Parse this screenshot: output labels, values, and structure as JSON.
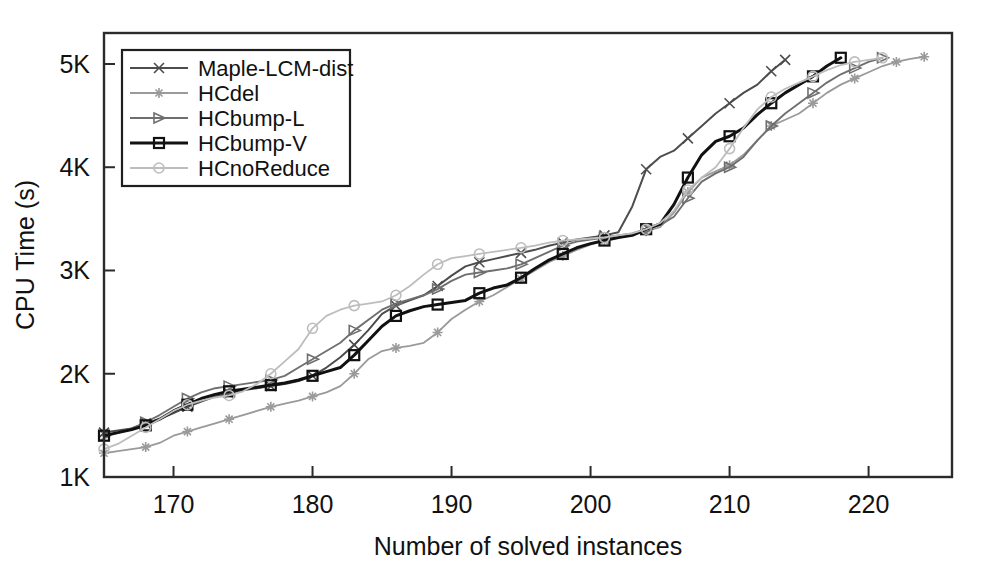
{
  "chart_data": {
    "type": "line",
    "title": "",
    "xlabel": "Number of solved instances",
    "ylabel": "CPU Time (s)",
    "xlim": [
      165,
      226
    ],
    "ylim": [
      1000,
      5300
    ],
    "grid": false,
    "legend_position": "top-left",
    "xticks": [
      170,
      180,
      190,
      200,
      210,
      220
    ],
    "xticklabels": [
      "170",
      "180",
      "190",
      "200",
      "210",
      "220"
    ],
    "yticks": [
      1000,
      2000,
      3000,
      4000,
      5000
    ],
    "yticklabels": [
      "1K",
      "2K",
      "3K",
      "4K",
      "5K"
    ],
    "series": [
      {
        "name": "Maple-LCM-dist",
        "color": "#4d4d4d",
        "width": 2.0,
        "marker": "x",
        "marker_every": 3,
        "x": [
          165,
          166,
          167,
          168,
          169,
          170,
          171,
          172,
          173,
          174,
          175,
          176,
          177,
          178,
          179,
          180,
          181,
          182,
          183,
          184,
          185,
          186,
          187,
          188,
          189,
          190,
          191,
          192,
          193,
          194,
          195,
          196,
          197,
          198,
          199,
          200,
          201,
          202,
          203,
          204,
          205,
          206,
          207,
          208,
          209,
          210,
          211,
          212,
          213,
          214
        ],
        "y": [
          1430,
          1450,
          1470,
          1520,
          1560,
          1620,
          1680,
          1730,
          1780,
          1810,
          1840,
          1860,
          1880,
          1900,
          1930,
          1980,
          2060,
          2160,
          2280,
          2420,
          2580,
          2660,
          2710,
          2760,
          2850,
          2950,
          3040,
          3080,
          3110,
          3140,
          3170,
          3200,
          3240,
          3270,
          3300,
          3320,
          3340,
          3370,
          3620,
          3980,
          4100,
          4160,
          4280,
          4400,
          4520,
          4620,
          4720,
          4800,
          4930,
          5040
        ]
      },
      {
        "name": "HCdel",
        "color": "#9a9a9a",
        "width": 1.8,
        "marker": "star",
        "marker_every": 3,
        "x": [
          165,
          166,
          167,
          168,
          169,
          170,
          171,
          172,
          173,
          174,
          175,
          176,
          177,
          178,
          179,
          180,
          181,
          182,
          183,
          184,
          185,
          186,
          187,
          188,
          189,
          190,
          191,
          192,
          193,
          194,
          195,
          196,
          197,
          198,
          199,
          200,
          201,
          202,
          203,
          204,
          205,
          206,
          207,
          208,
          209,
          210,
          211,
          212,
          213,
          214,
          215,
          216,
          217,
          218,
          219,
          220,
          221,
          222,
          223,
          224
        ],
        "y": [
          1230,
          1250,
          1270,
          1290,
          1330,
          1400,
          1440,
          1480,
          1520,
          1560,
          1600,
          1640,
          1680,
          1710,
          1740,
          1780,
          1820,
          1880,
          2000,
          2140,
          2220,
          2250,
          2270,
          2300,
          2400,
          2530,
          2620,
          2700,
          2760,
          2840,
          2920,
          3000,
          3080,
          3140,
          3200,
          3250,
          3290,
          3320,
          3340,
          3380,
          3420,
          3560,
          3760,
          3900,
          3960,
          4020,
          4120,
          4260,
          4400,
          4460,
          4520,
          4620,
          4720,
          4800,
          4860,
          4920,
          4980,
          5020,
          5050,
          5070
        ]
      },
      {
        "name": "HCbump-L",
        "color": "#6f6f6f",
        "width": 1.9,
        "marker": "triangle",
        "marker_every": 3,
        "x": [
          165,
          166,
          167,
          168,
          169,
          170,
          171,
          172,
          173,
          174,
          175,
          176,
          177,
          178,
          179,
          180,
          181,
          182,
          183,
          184,
          185,
          186,
          187,
          188,
          189,
          190,
          191,
          192,
          193,
          194,
          195,
          196,
          197,
          198,
          199,
          200,
          201,
          202,
          203,
          204,
          205,
          206,
          207,
          208,
          209,
          210,
          211,
          212,
          213,
          214,
          215,
          216,
          217,
          218,
          219,
          220,
          221
        ],
        "y": [
          1400,
          1430,
          1470,
          1530,
          1600,
          1680,
          1760,
          1820,
          1860,
          1880,
          1900,
          1920,
          1940,
          1980,
          2060,
          2140,
          2220,
          2300,
          2420,
          2520,
          2620,
          2680,
          2720,
          2760,
          2820,
          2900,
          2960,
          2980,
          3000,
          3020,
          3060,
          3120,
          3180,
          3240,
          3280,
          3300,
          3320,
          3340,
          3360,
          3400,
          3440,
          3520,
          3700,
          3860,
          3940,
          4000,
          4100,
          4260,
          4400,
          4520,
          4620,
          4720,
          4820,
          4900,
          4960,
          5020,
          5060
        ]
      },
      {
        "name": "HCbump-V",
        "color": "#111111",
        "width": 3.0,
        "marker": "square",
        "marker_every": 3,
        "x": [
          165,
          166,
          167,
          168,
          169,
          170,
          171,
          172,
          173,
          174,
          175,
          176,
          177,
          178,
          179,
          180,
          181,
          182,
          183,
          184,
          185,
          186,
          187,
          188,
          189,
          190,
          191,
          192,
          193,
          194,
          195,
          196,
          197,
          198,
          199,
          200,
          201,
          202,
          203,
          204,
          205,
          206,
          207,
          208,
          209,
          210,
          211,
          212,
          213,
          214,
          215,
          216,
          217,
          218
        ],
        "y": [
          1400,
          1430,
          1460,
          1500,
          1560,
          1640,
          1700,
          1760,
          1800,
          1830,
          1850,
          1870,
          1890,
          1910,
          1940,
          1980,
          2020,
          2060,
          2180,
          2320,
          2460,
          2560,
          2610,
          2650,
          2670,
          2690,
          2710,
          2780,
          2830,
          2860,
          2930,
          3020,
          3100,
          3160,
          3220,
          3260,
          3290,
          3320,
          3340,
          3400,
          3450,
          3640,
          3900,
          4120,
          4250,
          4300,
          4380,
          4510,
          4620,
          4720,
          4800,
          4880,
          4980,
          5060
        ]
      },
      {
        "name": "HCnoReduce",
        "color": "#bdbdbd",
        "width": 1.8,
        "marker": "circle",
        "marker_every": 3,
        "x": [
          165,
          166,
          167,
          168,
          169,
          170,
          171,
          172,
          173,
          174,
          175,
          176,
          177,
          178,
          179,
          180,
          181,
          182,
          183,
          184,
          185,
          186,
          187,
          188,
          189,
          190,
          191,
          192,
          193,
          194,
          195,
          196,
          197,
          198,
          199,
          200,
          201,
          202,
          203,
          204,
          205,
          206,
          207,
          208,
          209,
          210,
          211,
          212,
          213,
          214,
          215,
          216,
          217,
          218,
          219,
          220,
          221
        ],
        "y": [
          1270,
          1320,
          1400,
          1480,
          1560,
          1640,
          1700,
          1740,
          1770,
          1790,
          1830,
          1900,
          2000,
          2120,
          2240,
          2440,
          2560,
          2620,
          2660,
          2680,
          2700,
          2760,
          2850,
          2960,
          3060,
          3120,
          3140,
          3160,
          3180,
          3200,
          3220,
          3240,
          3270,
          3290,
          3300,
          3310,
          3320,
          3340,
          3360,
          3400,
          3460,
          3580,
          3780,
          3900,
          4000,
          4180,
          4380,
          4560,
          4680,
          4760,
          4820,
          4880,
          4940,
          4990,
          5020,
          5040,
          5060
        ]
      }
    ]
  }
}
